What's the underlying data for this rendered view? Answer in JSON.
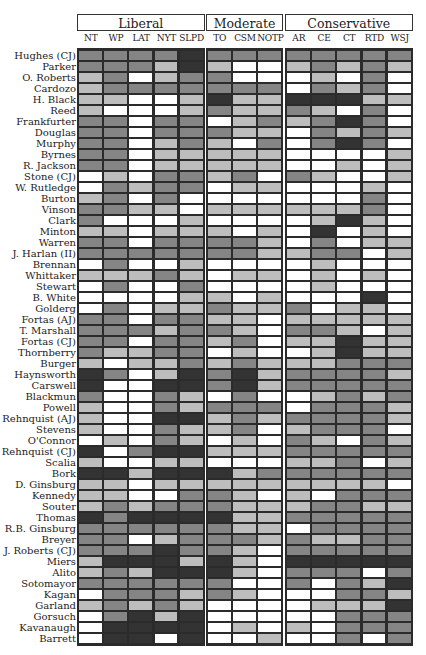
{
  "chart_data": {
    "type": "heatmap",
    "title": "",
    "groups": [
      {
        "name": "Liberal",
        "columns": [
          "NT",
          "WP",
          "LAT",
          "NYT",
          "SLPD"
        ]
      },
      {
        "name": "Moderate",
        "columns": [
          "TO",
          "CSM",
          "NOTP"
        ]
      },
      {
        "name": "Conservative",
        "columns": [
          "AR",
          "CE",
          "CT",
          "RTD",
          "WSJ"
        ]
      }
    ],
    "columns": [
      "NT",
      "WP",
      "LAT",
      "NYT",
      "SLPD",
      "TO",
      "CSM",
      "NOTP",
      "AR",
      "CE",
      "CT",
      "RTD",
      "WSJ"
    ],
    "rows": [
      "Hughes (CJ)",
      "Parker",
      "O. Roberts",
      "Cardozo",
      "H. Black",
      "Reed",
      "Frankfurter",
      "Douglas",
      "Murphy",
      "Byrnes",
      "R. Jackson",
      "Stone (CJ)",
      "W. Rutledge",
      "Burton",
      "Vinson",
      "Clark",
      "Minton",
      "Warren",
      "J. Harlan (II)",
      "Brennan",
      "Whittaker",
      "Stewart",
      "B. White",
      "Golderg",
      "Fortas (AJ)",
      "T. Marshall",
      "Fortas (CJ)",
      "Thornberry",
      "Burger",
      "Haynsworth",
      "Carswell",
      "Blackmun",
      "Powell",
      "Rehnquist (AJ)",
      "Stevens",
      "O'Connor",
      "Rehnquist (CJ)",
      "Scalia",
      "Bork",
      "D. Ginsburg",
      "Kennedy",
      "Souter",
      "Thomas",
      "R.B. Ginsburg",
      "Breyer",
      "J. Roberts (CJ)",
      "Miers",
      "Alito",
      "Sotomayor",
      "Kagan",
      "Garland",
      "Gorsuch",
      "Kavanaugh",
      "Barrett"
    ],
    "shade_levels": {
      "0": "#ffffff",
      "1": "#bdbdbd",
      "2": "#858585",
      "3": "#333333"
    },
    "values": [
      [
        2,
        2,
        2,
        2,
        3,
        2,
        2,
        2,
        2,
        2,
        2,
        2,
        2
      ],
      [
        2,
        2,
        2,
        1,
        3,
        1,
        0,
        0,
        1,
        2,
        1,
        2,
        1
      ],
      [
        1,
        2,
        0,
        1,
        2,
        2,
        0,
        0,
        0,
        1,
        0,
        2,
        0
      ],
      [
        1,
        2,
        2,
        2,
        2,
        2,
        2,
        2,
        0,
        2,
        1,
        2,
        0
      ],
      [
        1,
        1,
        0,
        0,
        1,
        3,
        1,
        1,
        3,
        3,
        3,
        1,
        1
      ],
      [
        1,
        0,
        0,
        0,
        1,
        2,
        1,
        1,
        2,
        1,
        0,
        2,
        0
      ],
      [
        2,
        2,
        0,
        2,
        2,
        0,
        1,
        2,
        1,
        2,
        3,
        2,
        0
      ],
      [
        2,
        2,
        0,
        2,
        2,
        2,
        1,
        1,
        0,
        2,
        1,
        2,
        1
      ],
      [
        2,
        2,
        0,
        1,
        2,
        1,
        0,
        2,
        0,
        2,
        3,
        2,
        0
      ],
      [
        2,
        2,
        0,
        1,
        1,
        1,
        1,
        1,
        0,
        0,
        0,
        0,
        1
      ],
      [
        2,
        2,
        0,
        1,
        1,
        1,
        1,
        1,
        0,
        0,
        1,
        0,
        1
      ],
      [
        0,
        1,
        0,
        2,
        2,
        1,
        2,
        0,
        2,
        1,
        0,
        0,
        1
      ],
      [
        0,
        2,
        1,
        2,
        2,
        0,
        1,
        1,
        0,
        0,
        0,
        1,
        0
      ],
      [
        1,
        2,
        0,
        2,
        0,
        0,
        0,
        0,
        0,
        0,
        0,
        2,
        0
      ],
      [
        2,
        2,
        1,
        1,
        0,
        1,
        1,
        1,
        1,
        1,
        1,
        2,
        0
      ],
      [
        2,
        0,
        0,
        0,
        1,
        0,
        0,
        0,
        0,
        1,
        3,
        1,
        0
      ],
      [
        1,
        1,
        0,
        1,
        1,
        1,
        0,
        1,
        0,
        3,
        0,
        1,
        0
      ],
      [
        2,
        2,
        0,
        2,
        2,
        2,
        2,
        1,
        0,
        2,
        0,
        1,
        1
      ],
      [
        2,
        2,
        2,
        2,
        2,
        2,
        2,
        1,
        1,
        2,
        2,
        0,
        1
      ],
      [
        0,
        2,
        0,
        0,
        1,
        0,
        0,
        0,
        0,
        1,
        0,
        0,
        0
      ],
      [
        1,
        1,
        1,
        2,
        1,
        0,
        1,
        1,
        0,
        1,
        0,
        1,
        0
      ],
      [
        0,
        2,
        0,
        0,
        2,
        0,
        0,
        0,
        0,
        1,
        0,
        0,
        0
      ],
      [
        0,
        0,
        0,
        0,
        1,
        1,
        0,
        1,
        0,
        0,
        0,
        3,
        0
      ],
      [
        0,
        2,
        0,
        1,
        1,
        2,
        1,
        1,
        2,
        0,
        1,
        1,
        0
      ],
      [
        2,
        2,
        0,
        2,
        2,
        1,
        1,
        0,
        1,
        1,
        1,
        1,
        1
      ],
      [
        2,
        2,
        2,
        1,
        2,
        2,
        1,
        0,
        2,
        2,
        1,
        0,
        1
      ],
      [
        2,
        2,
        0,
        2,
        2,
        1,
        2,
        0,
        1,
        1,
        3,
        1,
        1
      ],
      [
        2,
        1,
        1,
        2,
        2,
        0,
        1,
        0,
        0,
        1,
        3,
        1,
        1
      ],
      [
        1,
        0,
        1,
        1,
        2,
        1,
        2,
        1,
        1,
        1,
        2,
        2,
        2
      ],
      [
        3,
        2,
        0,
        1,
        3,
        2,
        3,
        1,
        2,
        2,
        2,
        2,
        1
      ],
      [
        3,
        0,
        0,
        3,
        3,
        2,
        3,
        1,
        2,
        2,
        2,
        2,
        2
      ],
      [
        2,
        0,
        0,
        2,
        1,
        0,
        2,
        0,
        0,
        1,
        2,
        1,
        2
      ],
      [
        1,
        0,
        0,
        2,
        1,
        2,
        2,
        2,
        0,
        2,
        2,
        2,
        1
      ],
      [
        1,
        0,
        0,
        3,
        3,
        1,
        2,
        1,
        2,
        2,
        2,
        2,
        1
      ],
      [
        1,
        0,
        0,
        2,
        1,
        1,
        2,
        0,
        1,
        2,
        2,
        2,
        0
      ],
      [
        0,
        1,
        0,
        2,
        1,
        0,
        1,
        0,
        2,
        1,
        0,
        2,
        1
      ],
      [
        3,
        0,
        2,
        3,
        3,
        1,
        1,
        1,
        2,
        2,
        2,
        2,
        2
      ],
      [
        1,
        0,
        0,
        1,
        1,
        0,
        0,
        0,
        1,
        1,
        2,
        0,
        1
      ],
      [
        3,
        3,
        1,
        3,
        3,
        3,
        1,
        2,
        2,
        2,
        2,
        2,
        2
      ],
      [
        1,
        1,
        0,
        1,
        1,
        1,
        1,
        1,
        1,
        1,
        1,
        1,
        0
      ],
      [
        1,
        1,
        0,
        0,
        2,
        2,
        1,
        0,
        1,
        0,
        2,
        2,
        2
      ],
      [
        1,
        2,
        1,
        2,
        2,
        2,
        1,
        1,
        1,
        2,
        2,
        1,
        1
      ],
      [
        3,
        2,
        3,
        3,
        3,
        3,
        1,
        1,
        2,
        2,
        2,
        2,
        2
      ],
      [
        2,
        2,
        2,
        2,
        2,
        2,
        1,
        1,
        0,
        2,
        2,
        2,
        2
      ],
      [
        2,
        2,
        0,
        1,
        2,
        2,
        2,
        1,
        2,
        1,
        1,
        2,
        2
      ],
      [
        2,
        2,
        2,
        3,
        2,
        2,
        1,
        0,
        2,
        2,
        2,
        2,
        2
      ],
      [
        1,
        3,
        3,
        3,
        1,
        3,
        1,
        0,
        3,
        3,
        3,
        3,
        3
      ],
      [
        1,
        2,
        1,
        3,
        3,
        3,
        1,
        0,
        2,
        2,
        2,
        0,
        2
      ],
      [
        2,
        2,
        2,
        2,
        2,
        2,
        0,
        0,
        2,
        0,
        2,
        1,
        3
      ],
      [
        0,
        2,
        2,
        2,
        1,
        2,
        1,
        0,
        0,
        0,
        2,
        2,
        1
      ],
      [
        1,
        2,
        1,
        2,
        1,
        0,
        0,
        0,
        0,
        1,
        1,
        1,
        3
      ],
      [
        0,
        2,
        3,
        1,
        3,
        0,
        0,
        0,
        0,
        0,
        2,
        2,
        2
      ],
      [
        0,
        3,
        3,
        3,
        3,
        0,
        1,
        0,
        1,
        0,
        2,
        2,
        2
      ],
      [
        0,
        3,
        3,
        0,
        3,
        0,
        0,
        1,
        0,
        0,
        2,
        0,
        2
      ]
    ],
    "legend": "none"
  }
}
